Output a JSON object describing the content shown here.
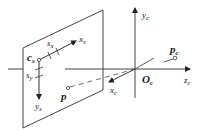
{
  "diagram": {
    "type": "camera-projection-geometry",
    "image_plane": {
      "origin_label": "c",
      "origin_sub": "s",
      "x_axis_label": "x",
      "x_axis_sub": "s",
      "y_axis_label": "y",
      "y_axis_sub": "s",
      "x_spacing_label": "s",
      "x_spacing_sub": "x",
      "y_spacing_label": "s",
      "y_spacing_sub": "y",
      "projected_point_label": "p"
    },
    "camera_frame": {
      "origin_label": "O",
      "origin_sub": "c",
      "x_axis_label": "x",
      "x_axis_sub": "c",
      "y_axis_label": "y",
      "y_axis_sub": "c",
      "z_axis_label": "z",
      "z_axis_sub": "c",
      "point_label": "p",
      "point_sub": "c"
    },
    "colors": {
      "line": "#333333",
      "dashed": "#444444",
      "text": "#222222"
    }
  }
}
